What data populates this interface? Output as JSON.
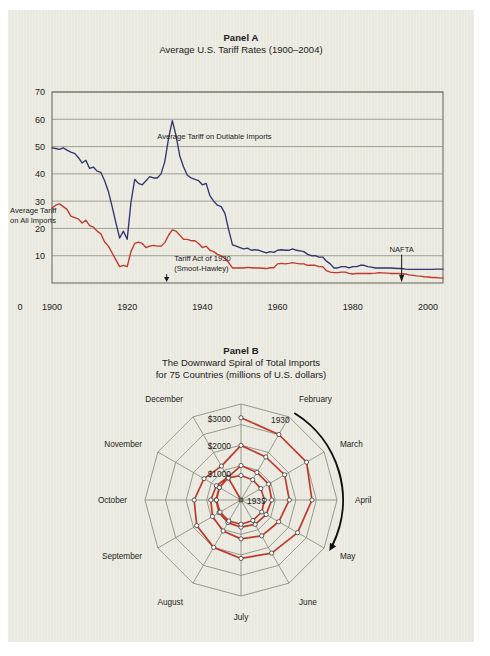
{
  "figure": {
    "background_color": "#e9e9df",
    "page_color": "#ffffff"
  },
  "panel_a": {
    "panel_label": "Panel A",
    "title": "Average U.S. Tariff Rates (1900–2004)",
    "series_label_dutiable": "Average Tariff on Dutiable Imports",
    "series_label_all_line1": "Average Tariff",
    "series_label_all_line2": "on All Imports",
    "annotation_smoot_line1": "Tariff Act of 1930",
    "annotation_smoot_line2": "(Smoot-Hawley)",
    "annotation_nafta": "NAFTA",
    "origin_label": "0",
    "colors": {
      "dutiable": "#33356b",
      "all_imports": "#c0392b",
      "grid": "#8d8d82",
      "frame": "#6e6e64"
    }
  },
  "panel_b": {
    "panel_label": "Panel B",
    "title_line1": "The Downward Spiral of Total Imports",
    "title_line2": "for 75 Countries (millions of U.S. dollars)",
    "ring_labels": [
      "$3000",
      "$2000",
      "$1000"
    ],
    "year_outer": "1930",
    "year_inner": "1933",
    "months": [
      "January",
      "February",
      "March",
      "April",
      "May",
      "June",
      "July",
      "August",
      "September",
      "October",
      "November",
      "December"
    ],
    "colors": {
      "spiral": "#c0392b",
      "grid": "#7d7d72",
      "marker_fill": "#ffffff"
    },
    "direction_arrow": "clockwise"
  },
  "chart_data": [
    {
      "type": "line",
      "id": "panel-a",
      "title": "Average U.S. Tariff Rates (1900–2004)",
      "xlabel": "",
      "ylabel": "",
      "xlim": [
        1900,
        2004
      ],
      "ylim": [
        0,
        70
      ],
      "xticks": [
        1900,
        1920,
        1940,
        1960,
        1980,
        2000
      ],
      "xticklabels": [
        "1900",
        "1920",
        "1940",
        "1960",
        "1980",
        "2000"
      ],
      "yticks": [
        10,
        20,
        30,
        40,
        50,
        60,
        70
      ],
      "yticklabels": [
        "10",
        "20",
        "30",
        "40",
        "50",
        "60",
        "70"
      ],
      "grid": "horizontal",
      "legend": "inline-annotations",
      "annotations": [
        {
          "text": "Average Tariff on Dutiable Imports",
          "x": 1936,
          "y": 56
        },
        {
          "text": "Average Tariff\non All Imports",
          "x": 1901,
          "y": 26
        },
        {
          "text": "Tariff Act of 1930\n(Smoot-Hawley)",
          "x": 1930,
          "y": 6
        },
        {
          "text": "NAFTA",
          "x": 1993,
          "y": 8
        }
      ],
      "series": [
        {
          "name": "Average Tariff on Dutiable Imports",
          "color": "#33356b",
          "x": [
            1900,
            1901,
            1902,
            1903,
            1904,
            1905,
            1906,
            1907,
            1908,
            1909,
            1910,
            1911,
            1912,
            1913,
            1914,
            1915,
            1916,
            1917,
            1918,
            1919,
            1920,
            1921,
            1922,
            1923,
            1924,
            1925,
            1926,
            1927,
            1928,
            1929,
            1930,
            1931,
            1932,
            1933,
            1934,
            1935,
            1936,
            1937,
            1938,
            1939,
            1940,
            1941,
            1942,
            1943,
            1944,
            1945,
            1946,
            1947,
            1948,
            1949,
            1950,
            1951,
            1952,
            1953,
            1954,
            1955,
            1956,
            1957,
            1958,
            1959,
            1960,
            1961,
            1962,
            1963,
            1964,
            1965,
            1966,
            1967,
            1968,
            1969,
            1970,
            1971,
            1972,
            1973,
            1974,
            1975,
            1976,
            1977,
            1978,
            1979,
            1980,
            1981,
            1982,
            1983,
            1984,
            1985,
            1986,
            1987,
            1988,
            1989,
            1990,
            1991,
            1992,
            1993,
            1994,
            1995,
            1996,
            1997,
            1998,
            1999,
            2000,
            2001,
            2002,
            2003,
            2004
          ],
          "y": [
            49.5,
            49.3,
            49.0,
            49.5,
            48.7,
            48.0,
            47.5,
            46.0,
            44.0,
            45.0,
            42.0,
            42.5,
            41.0,
            40.5,
            37.5,
            33.5,
            28.0,
            22.0,
            16.5,
            19.0,
            16.0,
            29.5,
            38.0,
            36.5,
            36.0,
            37.5,
            39.0,
            38.5,
            38.5,
            40.0,
            44.5,
            53.0,
            59.5,
            54.0,
            46.5,
            42.5,
            39.5,
            38.5,
            38.0,
            37.5,
            36.0,
            36.5,
            32.0,
            30.0,
            28.5,
            28.0,
            25.5,
            19.5,
            14.0,
            13.5,
            13.0,
            12.5,
            12.8,
            12.0,
            12.2,
            12.0,
            11.5,
            11.0,
            11.5,
            11.2,
            12.0,
            12.2,
            12.0,
            12.0,
            12.5,
            12.0,
            11.8,
            11.5,
            10.5,
            10.0,
            10.0,
            9.5,
            9.5,
            8.0,
            7.0,
            5.5,
            5.5,
            6.0,
            6.0,
            5.5,
            6.0,
            6.0,
            6.5,
            6.5,
            6.0,
            5.8,
            5.5,
            5.5,
            5.5,
            5.5,
            5.5,
            5.4,
            5.3,
            5.3,
            5.1,
            5.0,
            5.0,
            5.0,
            5.0,
            5.0,
            5.0,
            5.0,
            5.1,
            5.1,
            5.1
          ]
        },
        {
          "name": "Average Tariff on All Imports",
          "color": "#c0392b",
          "x": [
            1900,
            1901,
            1902,
            1903,
            1904,
            1905,
            1906,
            1907,
            1908,
            1909,
            1910,
            1911,
            1912,
            1913,
            1914,
            1915,
            1916,
            1917,
            1918,
            1919,
            1920,
            1921,
            1922,
            1923,
            1924,
            1925,
            1926,
            1927,
            1928,
            1929,
            1930,
            1931,
            1932,
            1933,
            1934,
            1935,
            1936,
            1937,
            1938,
            1939,
            1940,
            1941,
            1942,
            1943,
            1944,
            1945,
            1946,
            1947,
            1948,
            1949,
            1950,
            1951,
            1952,
            1953,
            1954,
            1955,
            1956,
            1957,
            1958,
            1959,
            1960,
            1961,
            1962,
            1963,
            1964,
            1965,
            1966,
            1967,
            1968,
            1969,
            1970,
            1971,
            1972,
            1973,
            1974,
            1975,
            1976,
            1977,
            1978,
            1979,
            1980,
            1981,
            1982,
            1983,
            1984,
            1985,
            1986,
            1987,
            1988,
            1989,
            1990,
            1991,
            1992,
            1993,
            1994,
            1995,
            1996,
            1997,
            1998,
            1999,
            2000,
            2001,
            2002,
            2003,
            2004
          ],
          "y": [
            27.5,
            28.5,
            29.0,
            28.0,
            27.0,
            24.5,
            24.0,
            23.5,
            22.0,
            23.0,
            21.0,
            20.5,
            19.0,
            18.0,
            15.0,
            13.5,
            11.0,
            8.5,
            6.0,
            6.5,
            6.0,
            11.5,
            14.5,
            15.0,
            14.5,
            13.0,
            13.5,
            13.8,
            13.5,
            13.5,
            14.8,
            17.5,
            19.5,
            19.0,
            17.5,
            16.0,
            16.0,
            15.5,
            15.5,
            14.5,
            13.0,
            13.5,
            12.0,
            11.5,
            10.5,
            10.0,
            9.0,
            7.5,
            5.5,
            5.5,
            5.5,
            5.5,
            5.7,
            5.6,
            5.5,
            5.5,
            5.4,
            5.3,
            5.6,
            5.6,
            7.0,
            7.2,
            7.0,
            7.2,
            7.5,
            7.2,
            7.0,
            7.0,
            6.5,
            6.5,
            6.5,
            6.0,
            6.0,
            4.5,
            4.0,
            3.8,
            3.8,
            4.0,
            4.0,
            3.5,
            3.3,
            3.5,
            3.5,
            3.5,
            3.5,
            3.5,
            3.6,
            3.8,
            3.7,
            3.6,
            3.5,
            3.5,
            3.5,
            3.4,
            3.3,
            3.0,
            2.8,
            2.6,
            2.5,
            2.3,
            2.2,
            2.0,
            2.0,
            1.9,
            1.8
          ]
        }
      ]
    },
    {
      "type": "radar",
      "id": "panel-b",
      "title": "The Downward Spiral of Total Imports for 75 Countries (millions of U.S. dollars)",
      "categories": [
        "January",
        "February",
        "March",
        "April",
        "May",
        "June",
        "July",
        "August",
        "September",
        "October",
        "November",
        "December"
      ],
      "radial_ticks": [
        1000,
        2000,
        3000
      ],
      "radial_ticklabels": [
        "$1000",
        "$2000",
        "$3000"
      ],
      "rlim": [
        0,
        3500
      ],
      "direction": "clockwise, inward spiral",
      "spiral_start_label": "1930",
      "spiral_end_label": "1933",
      "loops": [
        {
          "year": "1930",
          "values": [
            2998,
            2839,
            2919,
            2801,
            2670,
            2568,
            2529,
            2454,
            2410,
            2296,
            2188,
            2095
          ]
        },
        {
          "year": "1931",
          "values": [
            1992,
            1867,
            1960,
            1944,
            1806,
            1770,
            1733,
            1667,
            1592,
            1511,
            1432,
            1367
          ]
        },
        {
          "year": "1932",
          "values": [
            1256,
            1187,
            1230,
            1212,
            1150,
            1145,
            1100,
            1044,
            1004,
            964,
            958,
            920
          ]
        },
        {
          "year": "1933",
          "values": [
            893,
            853,
            834,
            855,
            874,
            864,
            883,
            884,
            883,
            897,
            908,
            930
          ]
        }
      ]
    }
  ]
}
